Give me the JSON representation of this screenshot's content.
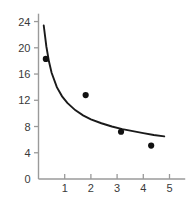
{
  "chart_data": {
    "type": "scatter",
    "title": "",
    "subtitle": "",
    "xlabel": "",
    "ylabel": "",
    "xlim": [
      0,
      5.6
    ],
    "ylim": [
      0,
      25.2
    ],
    "grid": false,
    "legend": null,
    "x_ticks": [
      1,
      2,
      3,
      4,
      5
    ],
    "x_tick_labels": [
      "1",
      "2",
      "3",
      "4",
      "5"
    ],
    "y_ticks": [
      0,
      4,
      8,
      12,
      16,
      20,
      24
    ],
    "y_tick_labels": [
      "0",
      "4",
      "8",
      "12",
      "16",
      "20",
      "24"
    ],
    "series": [
      {
        "name": "data points",
        "type": "scatter",
        "marker": "circle",
        "color": "#111111",
        "points": [
          {
            "x": 0.28,
            "y": 18.3
          },
          {
            "x": 1.8,
            "y": 12.8
          },
          {
            "x": 3.15,
            "y": 7.2
          },
          {
            "x": 4.3,
            "y": 5.1
          }
        ]
      },
      {
        "name": "fitted curve",
        "type": "line",
        "color": "#1a1a1a",
        "points": [
          {
            "x": 0.2,
            "y": 23.4
          },
          {
            "x": 0.3,
            "y": 20.2
          },
          {
            "x": 0.4,
            "y": 17.9
          },
          {
            "x": 0.5,
            "y": 16.2
          },
          {
            "x": 0.7,
            "y": 14.0
          },
          {
            "x": 0.9,
            "y": 12.6
          },
          {
            "x": 1.1,
            "y": 11.6
          },
          {
            "x": 1.4,
            "y": 10.5
          },
          {
            "x": 1.7,
            "y": 9.7
          },
          {
            "x": 2.0,
            "y": 9.1
          },
          {
            "x": 2.4,
            "y": 8.5
          },
          {
            "x": 2.8,
            "y": 8.0
          },
          {
            "x": 3.2,
            "y": 7.6
          },
          {
            "x": 3.6,
            "y": 7.3
          },
          {
            "x": 4.0,
            "y": 7.0
          },
          {
            "x": 4.4,
            "y": 6.7
          },
          {
            "x": 4.8,
            "y": 6.5
          }
        ]
      }
    ]
  },
  "axes": {
    "axis_color": "#9a9a9a",
    "tick_color": "#9a9a9a",
    "label_color": "#3a3a3a"
  },
  "background": {
    "color": "#ffffff"
  }
}
